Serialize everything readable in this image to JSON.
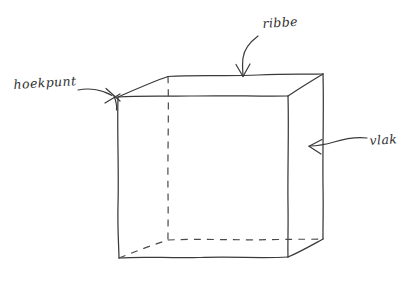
{
  "figure": {
    "kind": "hand-drawn-sketch",
    "background_color": "#ffffff",
    "ink_color": "#3a3a3a",
    "hidden_edge_style": "dashed"
  },
  "labels": {
    "vertex": "hoekpunt",
    "edge": "ribbe",
    "face": "vlak"
  },
  "annotations": [
    {
      "name": "hoekpunt",
      "text": "hoekpunt",
      "points_to": "front-top-left-vertex",
      "arrow_direction": "right"
    },
    {
      "name": "ribbe",
      "text": "ribbe",
      "points_to": "top-back-edge",
      "arrow_direction": "down"
    },
    {
      "name": "vlak",
      "text": "vlak",
      "points_to": "right-face",
      "arrow_direction": "left"
    }
  ]
}
